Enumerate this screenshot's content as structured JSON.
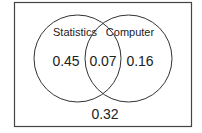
{
  "diagram": {
    "type": "venn",
    "sets": [
      {
        "name": "Statistics",
        "only_value": "0.45"
      },
      {
        "name": "Computer",
        "only_value": "0.16"
      }
    ],
    "intersection_value": "0.07",
    "outside_value": "0.32",
    "colors": {
      "stroke": "#333333",
      "background": "#ffffff",
      "text": "#222222"
    }
  }
}
